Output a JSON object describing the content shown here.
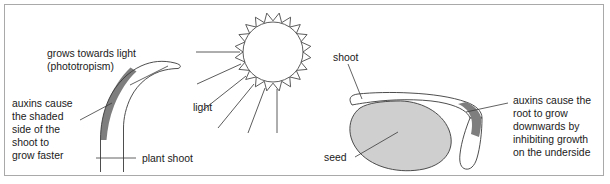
{
  "figure": {
    "domain": "diagram",
    "border_color": "#a9a9a9",
    "background_color": "#ffffff",
    "ink_color": "#3a3a3a",
    "seed_fill_color": "#cfcfcf",
    "shade_fill_color": "#7e7e7e"
  },
  "labels": {
    "grows_towards_light_line1": "grows towards light",
    "grows_towards_light_line2": "(phototropism)",
    "auxins_shoot_line1": "auxins cause",
    "auxins_shoot_line2": "the shaded",
    "auxins_shoot_line3": "side of the",
    "auxins_shoot_line4": "shoot to",
    "auxins_shoot_line5": "grow faster",
    "light": "light",
    "plant_shoot": "plant shoot",
    "shoot": "shoot",
    "seed": "seed",
    "auxins_root_line1": "auxins cause the",
    "auxins_root_line2": "root to grow",
    "auxins_root_line3": "downwards by",
    "auxins_root_line4": "inhibiting growth",
    "auxins_root_line5": "on the underside"
  },
  "elements": {
    "sun": {
      "name": "sun",
      "spike_count": 18
    },
    "light_rays": {
      "name": "light-rays",
      "count": 6
    },
    "plant_shoot": {
      "name": "plant-shoot",
      "bend_direction": "right, towards the sun"
    },
    "shoot_shaded_side": {
      "name": "shoot-shaded-side",
      "side": "left (away from light)"
    },
    "germinating_seed": {
      "name": "germinating-seed"
    },
    "seed_shoot": {
      "name": "seed-shoot",
      "direction": "left and upwards"
    },
    "seed_root": {
      "name": "seed-root",
      "direction": "right and downwards"
    },
    "root_shaded_side": {
      "name": "root-shaded-side",
      "side": "upper / inner bend"
    }
  }
}
